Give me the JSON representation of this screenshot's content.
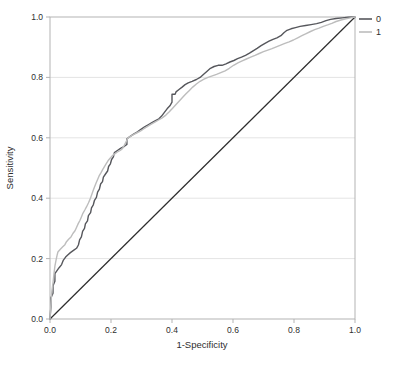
{
  "chart_data": {
    "type": "line",
    "subtype": "roc-curve",
    "title": "",
    "xlabel": "1-Specificity",
    "ylabel": "Sensitivity",
    "xlim": [
      0,
      1
    ],
    "ylim": [
      0,
      1
    ],
    "x_ticks": [
      "0.0",
      "0.2",
      "0.4",
      "0.6",
      "0.8",
      "1.0"
    ],
    "y_ticks": [
      "0.0",
      "0.2",
      "0.4",
      "0.6",
      "0.8",
      "1.0"
    ],
    "grid": "horizontal",
    "y_gridlines": [
      0.2,
      0.4,
      0.6,
      0.8
    ],
    "legend_position": "top-right",
    "colors": {
      "background": "#ffffff",
      "frame": "#b3b3b3",
      "grid": "#e4e4e4",
      "tick_text": "#2e2e2e",
      "reference": "#2d2d2d"
    },
    "reference_line": {
      "from": [
        0,
        0
      ],
      "to": [
        1,
        1
      ],
      "color": "#2d2d2d"
    },
    "series": [
      {
        "name": "0",
        "color": "#56575c",
        "points": [
          [
            0,
            0
          ],
          [
            0.003,
            0.04
          ],
          [
            0.003,
            0.07
          ],
          [
            0.01,
            0.085
          ],
          [
            0.01,
            0.11
          ],
          [
            0.016,
            0.125
          ],
          [
            0.016,
            0.15
          ],
          [
            0.023,
            0.16
          ],
          [
            0.03,
            0.17
          ],
          [
            0.038,
            0.18
          ],
          [
            0.044,
            0.195
          ],
          [
            0.051,
            0.205
          ],
          [
            0.059,
            0.213
          ],
          [
            0.067,
            0.22
          ],
          [
            0.077,
            0.227
          ],
          [
            0.087,
            0.234
          ],
          [
            0.093,
            0.245
          ],
          [
            0.097,
            0.262
          ],
          [
            0.103,
            0.272
          ],
          [
            0.107,
            0.29
          ],
          [
            0.113,
            0.3
          ],
          [
            0.116,
            0.315
          ],
          [
            0.123,
            0.325
          ],
          [
            0.126,
            0.342
          ],
          [
            0.133,
            0.352
          ],
          [
            0.136,
            0.368
          ],
          [
            0.142,
            0.378
          ],
          [
            0.146,
            0.393
          ],
          [
            0.152,
            0.403
          ],
          [
            0.156,
            0.42
          ],
          [
            0.162,
            0.43
          ],
          [
            0.166,
            0.447
          ],
          [
            0.172,
            0.455
          ],
          [
            0.175,
            0.47
          ],
          [
            0.182,
            0.48
          ],
          [
            0.189,
            0.49
          ],
          [
            0.192,
            0.505
          ],
          [
            0.198,
            0.514
          ],
          [
            0.202,
            0.528
          ],
          [
            0.208,
            0.537
          ],
          [
            0.211,
            0.551
          ],
          [
            0.221,
            0.558
          ],
          [
            0.231,
            0.565
          ],
          [
            0.244,
            0.572
          ],
          [
            0.252,
            0.578
          ],
          [
            0.252,
            0.597
          ],
          [
            0.262,
            0.604
          ],
          [
            0.274,
            0.612
          ],
          [
            0.287,
            0.62
          ],
          [
            0.298,
            0.628
          ],
          [
            0.31,
            0.636
          ],
          [
            0.322,
            0.643
          ],
          [
            0.334,
            0.65
          ],
          [
            0.346,
            0.657
          ],
          [
            0.357,
            0.663
          ],
          [
            0.366,
            0.672
          ],
          [
            0.375,
            0.684
          ],
          [
            0.384,
            0.696
          ],
          [
            0.393,
            0.706
          ],
          [
            0.4,
            0.718
          ],
          [
            0.4,
            0.744
          ],
          [
            0.41,
            0.744
          ],
          [
            0.413,
            0.752
          ],
          [
            0.423,
            0.76
          ],
          [
            0.433,
            0.768
          ],
          [
            0.443,
            0.776
          ],
          [
            0.453,
            0.782
          ],
          [
            0.466,
            0.787
          ],
          [
            0.48,
            0.793
          ],
          [
            0.492,
            0.8
          ],
          [
            0.503,
            0.81
          ],
          [
            0.514,
            0.82
          ],
          [
            0.526,
            0.83
          ],
          [
            0.538,
            0.836
          ],
          [
            0.551,
            0.84
          ],
          [
            0.564,
            0.84
          ],
          [
            0.577,
            0.845
          ],
          [
            0.59,
            0.851
          ],
          [
            0.603,
            0.856
          ],
          [
            0.615,
            0.862
          ],
          [
            0.628,
            0.867
          ],
          [
            0.641,
            0.873
          ],
          [
            0.654,
            0.88
          ],
          [
            0.666,
            0.888
          ],
          [
            0.679,
            0.896
          ],
          [
            0.692,
            0.905
          ],
          [
            0.705,
            0.913
          ],
          [
            0.718,
            0.92
          ],
          [
            0.731,
            0.926
          ],
          [
            0.744,
            0.931
          ],
          [
            0.757,
            0.938
          ],
          [
            0.767,
            0.948
          ],
          [
            0.777,
            0.956
          ],
          [
            0.79,
            0.961
          ],
          [
            0.805,
            0.965
          ],
          [
            0.82,
            0.969
          ],
          [
            0.838,
            0.972
          ],
          [
            0.856,
            0.975
          ],
          [
            0.874,
            0.978
          ],
          [
            0.89,
            0.982
          ],
          [
            0.905,
            0.988
          ],
          [
            0.92,
            0.992
          ],
          [
            0.938,
            0.995
          ],
          [
            0.958,
            0.997
          ],
          [
            0.978,
            0.999
          ],
          [
            1,
            1
          ]
        ]
      },
      {
        "name": "1",
        "color": "#bdbdbd",
        "points": [
          [
            0,
            0
          ],
          [
            0.003,
            0.05
          ],
          [
            0.006,
            0.09
          ],
          [
            0.01,
            0.12
          ],
          [
            0.013,
            0.15
          ],
          [
            0.016,
            0.175
          ],
          [
            0.02,
            0.196
          ],
          [
            0.023,
            0.21
          ],
          [
            0.026,
            0.222
          ],
          [
            0.033,
            0.23
          ],
          [
            0.041,
            0.238
          ],
          [
            0.049,
            0.246
          ],
          [
            0.054,
            0.256
          ],
          [
            0.061,
            0.264
          ],
          [
            0.069,
            0.272
          ],
          [
            0.075,
            0.283
          ],
          [
            0.082,
            0.292
          ],
          [
            0.087,
            0.303
          ],
          [
            0.092,
            0.315
          ],
          [
            0.098,
            0.326
          ],
          [
            0.103,
            0.338
          ],
          [
            0.108,
            0.35
          ],
          [
            0.114,
            0.361
          ],
          [
            0.12,
            0.372
          ],
          [
            0.126,
            0.384
          ],
          [
            0.131,
            0.396
          ],
          [
            0.136,
            0.41
          ],
          [
            0.141,
            0.424
          ],
          [
            0.146,
            0.437
          ],
          [
            0.151,
            0.45
          ],
          [
            0.156,
            0.462
          ],
          [
            0.161,
            0.474
          ],
          [
            0.167,
            0.484
          ],
          [
            0.172,
            0.494
          ],
          [
            0.178,
            0.504
          ],
          [
            0.184,
            0.514
          ],
          [
            0.19,
            0.524
          ],
          [
            0.197,
            0.532
          ],
          [
            0.204,
            0.54
          ],
          [
            0.212,
            0.547
          ],
          [
            0.221,
            0.553
          ],
          [
            0.23,
            0.558
          ],
          [
            0.238,
            0.565
          ],
          [
            0.244,
            0.576
          ],
          [
            0.25,
            0.588
          ],
          [
            0.254,
            0.598
          ],
          [
            0.262,
            0.604
          ],
          [
            0.272,
            0.61
          ],
          [
            0.284,
            0.616
          ],
          [
            0.296,
            0.622
          ],
          [
            0.308,
            0.63
          ],
          [
            0.32,
            0.638
          ],
          [
            0.332,
            0.645
          ],
          [
            0.344,
            0.652
          ],
          [
            0.356,
            0.659
          ],
          [
            0.368,
            0.666
          ],
          [
            0.38,
            0.675
          ],
          [
            0.391,
            0.686
          ],
          [
            0.402,
            0.698
          ],
          [
            0.413,
            0.71
          ],
          [
            0.424,
            0.722
          ],
          [
            0.435,
            0.734
          ],
          [
            0.446,
            0.746
          ],
          [
            0.457,
            0.757
          ],
          [
            0.468,
            0.768
          ],
          [
            0.48,
            0.778
          ],
          [
            0.492,
            0.787
          ],
          [
            0.505,
            0.794
          ],
          [
            0.518,
            0.8
          ],
          [
            0.532,
            0.805
          ],
          [
            0.546,
            0.81
          ],
          [
            0.56,
            0.816
          ],
          [
            0.574,
            0.822
          ],
          [
            0.588,
            0.83
          ],
          [
            0.602,
            0.84
          ],
          [
            0.616,
            0.848
          ],
          [
            0.63,
            0.855
          ],
          [
            0.644,
            0.861
          ],
          [
            0.658,
            0.867
          ],
          [
            0.672,
            0.873
          ],
          [
            0.686,
            0.879
          ],
          [
            0.7,
            0.885
          ],
          [
            0.714,
            0.89
          ],
          [
            0.728,
            0.895
          ],
          [
            0.742,
            0.901
          ],
          [
            0.756,
            0.907
          ],
          [
            0.77,
            0.913
          ],
          [
            0.784,
            0.918
          ],
          [
            0.798,
            0.924
          ],
          [
            0.812,
            0.931
          ],
          [
            0.826,
            0.938
          ],
          [
            0.84,
            0.945
          ],
          [
            0.854,
            0.952
          ],
          [
            0.868,
            0.958
          ],
          [
            0.882,
            0.963
          ],
          [
            0.896,
            0.969
          ],
          [
            0.91,
            0.974
          ],
          [
            0.924,
            0.979
          ],
          [
            0.938,
            0.985
          ],
          [
            0.954,
            0.99
          ],
          [
            0.97,
            0.994
          ],
          [
            0.985,
            0.997
          ],
          [
            1,
            1
          ]
        ]
      }
    ]
  },
  "legend": {
    "entries": [
      {
        "label": "0",
        "color": "#56575c"
      },
      {
        "label": "1",
        "color": "#bdbdbd"
      }
    ]
  }
}
